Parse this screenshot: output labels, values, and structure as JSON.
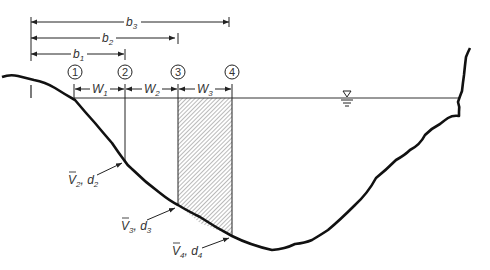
{
  "diagram": {
    "colors": {
      "line": "#1a1a1a",
      "hatch": "#555555",
      "background": "#ffffff"
    },
    "distances": [
      {
        "label": "b",
        "sub": "1"
      },
      {
        "label": "b",
        "sub": "2"
      },
      {
        "label": "b",
        "sub": "3"
      }
    ],
    "verticals": [
      "1",
      "2",
      "3",
      "4"
    ],
    "widths": [
      {
        "label": "W",
        "sub": "1"
      },
      {
        "label": "W",
        "sub": "2"
      },
      {
        "label": "W",
        "sub": "3"
      }
    ],
    "callouts": [
      {
        "v": "V",
        "vsub": "2",
        "d": "d",
        "dsub": "2"
      },
      {
        "v": "V",
        "vsub": "3",
        "d": "d",
        "dsub": "3"
      },
      {
        "v": "V",
        "vsub": "4",
        "d": "d",
        "dsub": "4"
      }
    ],
    "water_surface_symbol": "water-surface-icon"
  }
}
